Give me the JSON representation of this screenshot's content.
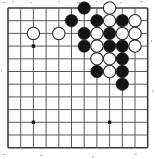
{
  "figure": {
    "kind": "go-board-diagram",
    "board": {
      "cols": 12,
      "rows": 12,
      "origin_x": 8,
      "origin_y": 8,
      "spacing": 12.7,
      "line_color": "#5a5a5a",
      "edge_color": "#3c3c3c",
      "background": "#ffffff",
      "line_width": 1,
      "edge_width": 1.6,
      "stone_radius": 6.2,
      "black_color": "#141414",
      "white_color": "#ffffff",
      "white_outline": "#2b2b2b",
      "star_color": "#141414",
      "star_radius": 1.7
    },
    "star_points": [
      {
        "col": 2,
        "row": 3
      },
      {
        "col": 2,
        "row": 9
      },
      {
        "col": 8,
        "row": 9
      }
    ],
    "stones": [
      {
        "color": "black",
        "col": 6,
        "row": 0
      },
      {
        "color": "white",
        "col": 8,
        "row": 0
      },
      {
        "color": "black",
        "col": 5,
        "row": 1
      },
      {
        "color": "black",
        "col": 7,
        "row": 1
      },
      {
        "color": "white",
        "col": 8,
        "row": 1
      },
      {
        "color": "black",
        "col": 9,
        "row": 1
      },
      {
        "color": "white",
        "col": 10,
        "row": 1
      },
      {
        "color": "white",
        "col": 2,
        "row": 2
      },
      {
        "color": "white",
        "col": 4,
        "row": 2
      },
      {
        "color": "black",
        "col": 6,
        "row": 2
      },
      {
        "color": "white",
        "col": 7,
        "row": 2
      },
      {
        "color": "black",
        "col": 8,
        "row": 2
      },
      {
        "color": "white",
        "col": 9,
        "row": 2
      },
      {
        "color": "white",
        "col": 10,
        "row": 2
      },
      {
        "color": "black",
        "col": 6,
        "row": 3
      },
      {
        "color": "white",
        "col": 7,
        "row": 3
      },
      {
        "color": "black",
        "col": 8,
        "row": 3
      },
      {
        "color": "black",
        "col": 9,
        "row": 3
      },
      {
        "color": "white",
        "col": 10,
        "row": 3
      },
      {
        "color": "white",
        "col": 7,
        "row": 4
      },
      {
        "color": "white",
        "col": 8,
        "row": 4
      },
      {
        "color": "black",
        "col": 9,
        "row": 4
      },
      {
        "color": "black",
        "col": 7,
        "row": 5
      },
      {
        "color": "white",
        "col": 8,
        "row": 5
      },
      {
        "color": "black",
        "col": 9,
        "row": 5
      },
      {
        "color": "black",
        "col": 9,
        "row": 6
      }
    ],
    "counts": {
      "black_stones": "15",
      "white_stones": "11",
      "total_stones": "26"
    }
  }
}
